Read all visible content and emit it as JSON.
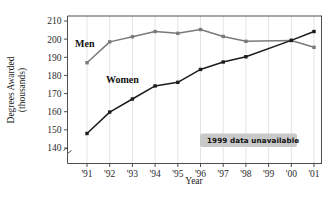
{
  "chart_data": {
    "type": "line",
    "title": "",
    "xlabel": "Year",
    "ylabel": "Degrees Awarded (thousands)",
    "ylabel_line1": "Degrees Awarded",
    "ylabel_line2": "(thousands)",
    "categories": [
      "'91",
      "'92",
      "'93",
      "'94",
      "'95",
      "'96",
      "'97",
      "'98",
      "'99",
      "'00",
      "'01"
    ],
    "x": [
      1991,
      1992,
      1993,
      1994,
      1995,
      1996,
      1997,
      1998,
      1999,
      2000,
      2001
    ],
    "ylim": [
      135,
      210
    ],
    "yticks": [
      140,
      150,
      160,
      170,
      180,
      190,
      200,
      210
    ],
    "ytick_labels": [
      "140",
      "150",
      "160",
      "170",
      "180",
      "190",
      "200",
      "210"
    ],
    "axis_break": true,
    "grid": "vertical",
    "legend": "inline-labels",
    "series": [
      {
        "name": "Men",
        "color": "#7a7a7a",
        "label_x": "'91",
        "values": [
          187.0,
          198.5,
          201.3,
          204.2,
          203.2,
          205.3,
          201.5,
          198.8,
          null,
          199.3,
          195.5
        ]
      },
      {
        "name": "Women",
        "color": "#1c1c1c",
        "label_x": "'93",
        "values": [
          148.0,
          159.8,
          167.0,
          174.2,
          176.2,
          183.3,
          187.4,
          190.3,
          null,
          199.3,
          204.2
        ]
      }
    ],
    "annotations": [
      {
        "name": "1999-data-unavailable-callout",
        "text": "1999 data unavailable",
        "points_to": "'99",
        "box_color": "#c9c9c9"
      }
    ]
  },
  "colors": {
    "men_line": "#7a7a7a",
    "women_line": "#1c1c1c",
    "grid": "#d8d8dc",
    "axis": "#3a3a3a",
    "callout_box": "#c9c9c9",
    "background": "#ffffff"
  }
}
